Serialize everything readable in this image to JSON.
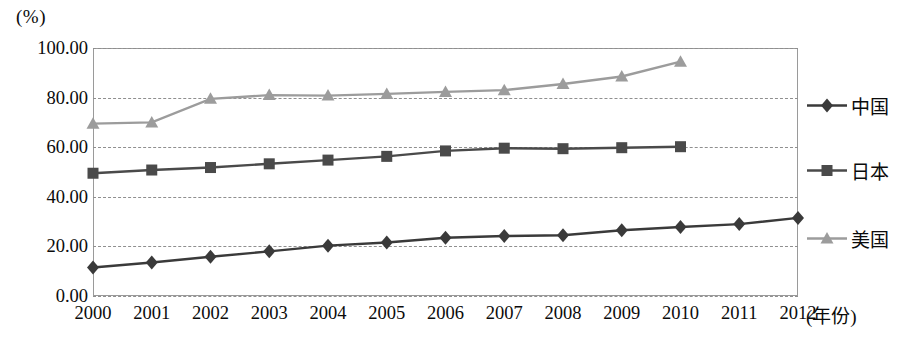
{
  "chart_data": {
    "type": "line",
    "title": "",
    "subtitle": "",
    "xlabel": "(年份)",
    "ylabel": "(%)",
    "x": [
      2000,
      2001,
      2002,
      2003,
      2004,
      2005,
      2006,
      2007,
      2008,
      2009,
      2010,
      2011,
      2012
    ],
    "categories": [
      "2000",
      "2001",
      "2002",
      "2003",
      "2004",
      "2005",
      "2006",
      "2007",
      "2008",
      "2009",
      "2010",
      "2011",
      "2012"
    ],
    "xlim": [
      2000,
      2012
    ],
    "ylim": [
      0,
      100
    ],
    "ytick_labels": [
      "100.00",
      "80.00",
      "60.00",
      "40.00",
      "20.00",
      "0.00"
    ],
    "ytick_values": [
      100,
      80,
      60,
      40,
      20,
      0
    ],
    "grid": true,
    "grid_style": "dashed-horizontal",
    "legend_position": "right",
    "series": [
      {
        "name": "中国",
        "marker": "diamond",
        "color": "#3a3a3a",
        "values": [
          11.5,
          13.5,
          15.8,
          18.0,
          20.3,
          21.6,
          23.5,
          24.2,
          24.5,
          26.5,
          27.8,
          29.0,
          31.5
        ]
      },
      {
        "name": "日本",
        "marker": "square",
        "color": "#4a4a4a",
        "values": [
          49.5,
          50.8,
          51.8,
          53.3,
          54.8,
          56.3,
          58.5,
          59.6,
          59.4,
          59.8,
          60.2,
          null,
          null
        ]
      },
      {
        "name": "美国",
        "marker": "triangle",
        "color": "#9c9c9c",
        "values": [
          69.5,
          70.0,
          79.5,
          81.0,
          80.8,
          81.5,
          82.3,
          83.0,
          85.5,
          88.5,
          94.5,
          null,
          null
        ]
      }
    ]
  },
  "legend": {
    "items": [
      {
        "label": "中国"
      },
      {
        "label": "日本"
      },
      {
        "label": "美国"
      }
    ]
  },
  "axes": {
    "y_unit": "(%)",
    "x_title": "(年份)"
  },
  "colors": {
    "china": "#3a3a3a",
    "japan": "#4a4a4a",
    "usa": "#9c9c9c",
    "grid": "#8f8f8f",
    "text": "#0b0b0b",
    "background": "#ffffff"
  }
}
